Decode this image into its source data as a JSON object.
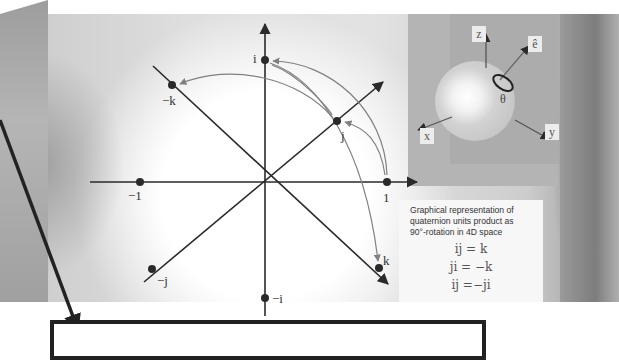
{
  "diagram": {
    "points": [
      {
        "id": "one",
        "label": "1",
        "x": 387,
        "y": 182
      },
      {
        "id": "minus-one",
        "label": "−1",
        "x": 140,
        "y": 182
      },
      {
        "id": "i",
        "label": "i",
        "x": 265,
        "y": 60
      },
      {
        "id": "minus-i",
        "label": "−i",
        "x": 265,
        "y": 298
      },
      {
        "id": "j",
        "label": "j",
        "x": 337,
        "y": 121
      },
      {
        "id": "minus-j",
        "label": "−j",
        "x": 152,
        "y": 269
      },
      {
        "id": "k",
        "label": "k",
        "x": 379,
        "y": 268
      },
      {
        "id": "minus-k",
        "label": "−k",
        "x": 172,
        "y": 85
      }
    ],
    "rotation_inset": {
      "axes": [
        "z",
        "ê",
        "x",
        "y"
      ],
      "angle_label": "θ"
    }
  },
  "caption": {
    "description": "Graphical representation of quaternion units product as 90°-rotation in 4D space",
    "line1": "Graphical representation of",
    "line2": "quaternion units product as",
    "line3": "90°-rotation in 4D space",
    "equations": [
      "ij = k",
      "ji = −k",
      "ij =−ji"
    ]
  },
  "labels": {
    "one": "1",
    "minus_one": "−1",
    "i": "i",
    "minus_i": "−i",
    "j": "j",
    "minus_j": "−j",
    "k": "k",
    "minus_k": "−k",
    "z": "z",
    "e_hat": "ê",
    "x": "x",
    "y": "y",
    "theta": "θ"
  },
  "colors": {
    "axis": "#2a2a2a",
    "arc": "#7a7a7a",
    "sphere": "#cdcdcd",
    "background_texture": "#d8d8d8"
  }
}
